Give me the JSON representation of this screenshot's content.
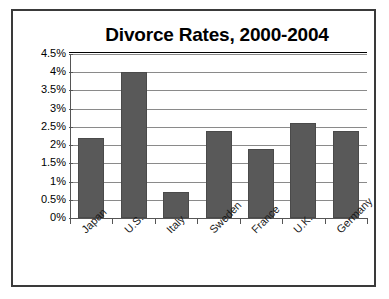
{
  "chart_data": {
    "type": "bar",
    "title": "Divorce Rates, 2000-2004",
    "xlabel": "",
    "ylabel": "",
    "categories": [
      "Japan",
      "U.S.",
      "Italy",
      "Sweden",
      "France",
      "U.K.",
      "Germany"
    ],
    "values": [
      2.2,
      4.0,
      0.7,
      2.4,
      1.9,
      2.6,
      2.4
    ],
    "value_unit": "%",
    "ylim": [
      0,
      4.5
    ],
    "ytick_values": [
      0,
      0.5,
      1,
      1.5,
      2,
      2.5,
      3,
      3.5,
      4,
      4.5
    ],
    "ytick_labels": [
      "0%",
      "0.5%",
      "1%",
      "1.5%",
      "2%",
      "2.5%",
      "3%",
      "3.5%",
      "4%",
      "4.5%"
    ],
    "grid": true,
    "legend": false,
    "legend_position": "none",
    "series": [
      {
        "name": "Divorce Rate",
        "values": [
          2.2,
          4.0,
          0.7,
          2.4,
          1.9,
          2.6,
          2.4
        ],
        "color": "#595959"
      }
    ],
    "bar_color": "#595959",
    "bar_border_color": "#4a4a4a",
    "gridline_color": "#8a8a8a",
    "axis_color": "#555555",
    "frame_color": "#3a3a3a",
    "background_color": "#ffffff",
    "xtick_label_rotation": -45
  }
}
